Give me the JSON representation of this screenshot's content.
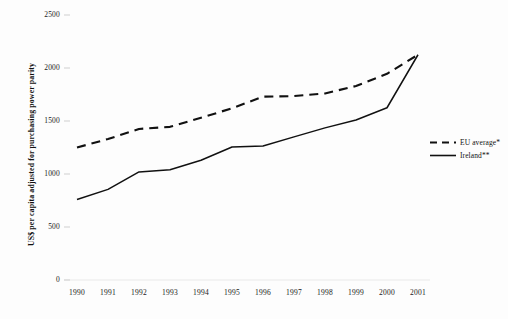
{
  "chart_data": {
    "type": "line",
    "title": "",
    "xlabel": "",
    "ylabel": "US$ per capita adjusted for purchasing power parity",
    "x": [
      1990,
      1991,
      1992,
      1993,
      1994,
      1995,
      1996,
      1997,
      1998,
      1999,
      2000,
      2001
    ],
    "xticklabels": [
      "1990",
      "1991",
      "1992",
      "1993",
      "1994",
      "1995",
      "1996",
      "1997",
      "1998",
      "1999",
      "2000",
      "2001"
    ],
    "yticks": [
      0,
      500,
      1000,
      1500,
      2000,
      2500
    ],
    "yticklabels": [
      "0",
      "500",
      "1000",
      "1500",
      "2000",
      "2500"
    ],
    "ylim": [
      0,
      2500
    ],
    "grid": false,
    "legend_position": "right",
    "series": [
      {
        "name": "EU average*",
        "style": "dashed",
        "color": "#111111",
        "values": [
          1250,
          1330,
          1425,
          1445,
          1530,
          1620,
          1730,
          1735,
          1760,
          1830,
          1945,
          2125
        ]
      },
      {
        "name": "Ireland**",
        "style": "solid",
        "color": "#111111",
        "values": [
          760,
          855,
          1020,
          1040,
          1130,
          1255,
          1265,
          1350,
          1435,
          1510,
          1625,
          2125
        ]
      }
    ]
  },
  "legend": {
    "items": [
      {
        "label": "EU average*",
        "style": "dashed"
      },
      {
        "label": "Ireland**",
        "style": "solid"
      }
    ]
  },
  "axis": {
    "y_title": "US$ per capita adjusted for purchasing power parity"
  }
}
